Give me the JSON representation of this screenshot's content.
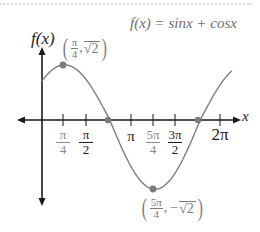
{
  "title": "f(x) = sinx + cosx",
  "axes": {
    "y_label": "f(x)",
    "x_label": "x"
  },
  "ticks": [
    {
      "id": "pi4",
      "num": "π",
      "den": "4",
      "style": "gray"
    },
    {
      "id": "pi2",
      "num": "π",
      "den": "2",
      "style": "dark"
    },
    {
      "id": "pi",
      "label": "π",
      "style": "dark"
    },
    {
      "id": "5pi4",
      "num": "5π",
      "den": "4",
      "style": "gray"
    },
    {
      "id": "3pi2",
      "num": "3π",
      "den": "2",
      "style": "dark"
    },
    {
      "id": "2pi",
      "label": "2π",
      "style": "dark"
    }
  ],
  "points": {
    "max": {
      "x_num": "π",
      "x_den": "4",
      "sep": ",",
      "y": "√2",
      "y_sign": ""
    },
    "min": {
      "x_num": "5π",
      "x_den": "4",
      "sep": ",",
      "y": "√2",
      "y_sign": "−"
    }
  },
  "colors": {
    "curve": "#7d7d7d",
    "point": "#7a7a7a",
    "axis": "#1a1a1a",
    "label_gray": "#8a8a8a",
    "dots": "#d7dde3"
  },
  "chart_data": {
    "type": "line",
    "title": "f(x) = sinx + cosx",
    "xlabel": "x",
    "ylabel": "f(x)",
    "x_ticks": [
      "π/4",
      "π/2",
      "π",
      "5π/4",
      "3π/2",
      "2π"
    ],
    "x_range": [
      0,
      6.6
    ],
    "y_range": [
      -1.414,
      1.414
    ],
    "series": [
      {
        "name": "f(x) = sinx + cosx",
        "function": "sin(x)+cos(x)",
        "x_start": 0,
        "x_end": 6.6
      }
    ],
    "annotated_points": [
      {
        "label": "(π/4, √2)",
        "x": 0.785,
        "y": 1.414,
        "type": "maximum"
      },
      {
        "label": "(5π/4, −√2)",
        "x": 3.927,
        "y": -1.414,
        "type": "minimum"
      },
      {
        "label": "zero",
        "x": 2.356,
        "y": 0
      },
      {
        "label": "zero",
        "x": 5.498,
        "y": 0
      }
    ],
    "grid": false
  }
}
